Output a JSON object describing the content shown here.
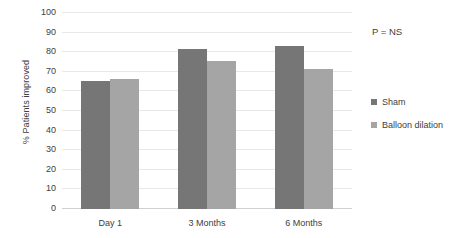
{
  "chart_data": {
    "type": "bar",
    "title": "",
    "xlabel": "",
    "ylabel": "% Patients improved",
    "ylim": [
      0,
      100
    ],
    "ytick_step": 10,
    "yticks": [
      100,
      90,
      80,
      70,
      60,
      50,
      40,
      30,
      20,
      10,
      0
    ],
    "categories": [
      "Day 1",
      "3 Months",
      "6 Months"
    ],
    "series": [
      {
        "name": "Sham",
        "color": "#767676",
        "values": [
          65.5,
          81.5,
          83
        ]
      },
      {
        "name": "Balloon dilation",
        "color": "#a5a5a5",
        "values": [
          66.5,
          75.5,
          71.5
        ]
      }
    ],
    "annotations": [
      {
        "text": "P = NS"
      }
    ],
    "grid": true,
    "legend_position": "right"
  }
}
